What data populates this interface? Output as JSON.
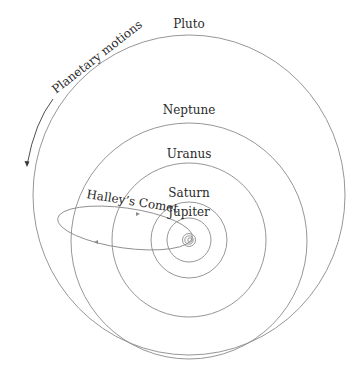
{
  "diagram": {
    "annotation": "Planetary motions",
    "labels": {
      "pluto": "Pluto",
      "neptune": "Neptune",
      "uranus": "Uranus",
      "saturn": "Saturn",
      "jupiter": "Jupiter",
      "halley": "Halley’s Comet"
    },
    "colors": {
      "orbit": "#8a8a8a",
      "text": "#2a2a2a",
      "background": "#ffffff"
    }
  }
}
